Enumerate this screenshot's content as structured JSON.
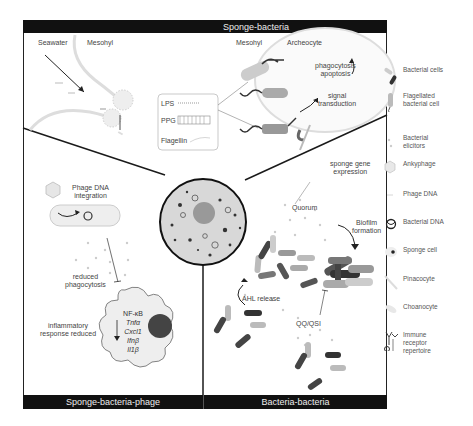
{
  "panels": {
    "top": {
      "title": "Sponge-bacteria"
    },
    "bottom_left": {
      "title": "Sponge-bacteria-phage"
    },
    "bottom_right": {
      "title": "Bacteria-bacteria"
    }
  },
  "top_panel": {
    "labels": {
      "seawater": "Seawater",
      "mesohyl_left": "Mesohyl",
      "mesohyl_right": "Mesohyl",
      "archeocyte": "Archeocyte",
      "phagocytosis": "phagocytosis\napoptosis",
      "signal": "signal\ntransduction"
    },
    "elicitor_box": {
      "items": [
        "LPS",
        "PPG",
        "Flagellin"
      ]
    }
  },
  "phage_panel": {
    "labels": {
      "integration": "Phage DNA\nintegration",
      "reduced_phago": "reduced\nphagocytosis",
      "inflammatory": "inflammatory\nresponse reduced"
    },
    "genes": [
      "NF-κB",
      "Tnfα",
      "Cxcl1",
      "Ifnβ",
      "Il1β"
    ]
  },
  "bacteria_panel": {
    "labels": {
      "sponge_gene": "sponge gene\nexpression",
      "quorum": "Quorum",
      "biofilm": "Biofilm\nformation",
      "ahl": "AHL release",
      "qq": "QQ/QSI"
    }
  },
  "legend": [
    {
      "icon": "bacterial-cells-icon",
      "label": "Bacterial cells"
    },
    {
      "icon": "flagellated-cell-icon",
      "label": "Flagellated\nbacterial cell"
    },
    {
      "icon": "elicitors-icon",
      "label": "Bacterial\nelicitors"
    },
    {
      "icon": "ankyphage-icon",
      "label": "Ankyphage"
    },
    {
      "icon": "phage-dna-icon",
      "label": "Phage DNA"
    },
    {
      "icon": "bacterial-dna-icon",
      "label": "Bacterial DNA"
    },
    {
      "icon": "sponge-cell-icon",
      "label": "Sponge cell"
    },
    {
      "icon": "pinacocyte-icon",
      "label": "Pinacocyte"
    },
    {
      "icon": "choanocyte-icon",
      "label": "Choanocyte"
    },
    {
      "icon": "immune-receptor-icon",
      "label": "Immune\nreceptor\nrepertoire"
    }
  ],
  "colors": {
    "bar": "#111111",
    "line": "#1a1a1a",
    "dark_bacteria": "#444444",
    "light_bacteria": "#bbbbbb",
    "mid_bacteria": "#888888"
  }
}
